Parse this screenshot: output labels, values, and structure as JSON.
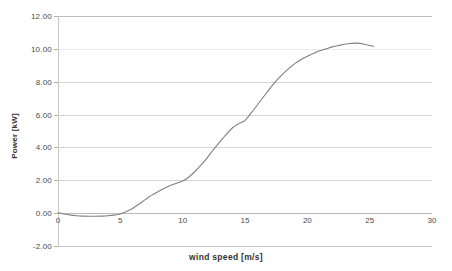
{
  "chart_data": {
    "type": "line",
    "title": "",
    "xlabel": "wind speed [m/s]",
    "ylabel": "Power [kW]",
    "xlim": [
      0,
      30
    ],
    "ylim": [
      -2.0,
      12.0
    ],
    "xticks": [
      0,
      5,
      10,
      15,
      20,
      25,
      30
    ],
    "xtick_labels": [
      "0",
      "5",
      "10",
      "15",
      "20",
      "25",
      "30"
    ],
    "yticks": [
      -2.0,
      0.0,
      2.0,
      4.0,
      6.0,
      8.0,
      10.0,
      12.0
    ],
    "ytick_labels": [
      "-2.00",
      "0.00",
      "2.00",
      "4.00",
      "6.00",
      "8.00",
      "10.00",
      "12.00"
    ],
    "grid": true,
    "grid_axis": "y",
    "legend": false,
    "legend_position": "none",
    "series": [
      {
        "name": "power curve",
        "color": "#808080",
        "x": [
          0.0,
          0.5,
          1.0,
          1.5,
          2.0,
          2.5,
          3.0,
          3.5,
          4.0,
          4.5,
          5.0,
          5.5,
          6.0,
          6.5,
          7.0,
          7.5,
          8.0,
          8.5,
          9.0,
          9.5,
          10.0,
          10.5,
          11.0,
          11.5,
          12.0,
          12.5,
          13.0,
          13.5,
          14.0,
          14.5,
          15.0,
          15.5,
          16.0,
          16.5,
          17.0,
          17.5,
          18.0,
          18.5,
          19.0,
          19.5,
          20.0,
          20.5,
          21.0,
          21.5,
          22.0,
          22.5,
          23.0,
          23.5,
          24.0,
          24.5,
          25.0,
          25.3
        ],
        "y": [
          0.02,
          -0.05,
          -0.12,
          -0.16,
          -0.18,
          -0.19,
          -0.19,
          -0.18,
          -0.16,
          -0.12,
          -0.05,
          0.1,
          0.3,
          0.55,
          0.82,
          1.08,
          1.3,
          1.5,
          1.68,
          1.82,
          1.95,
          2.2,
          2.55,
          2.95,
          3.4,
          3.9,
          4.35,
          4.8,
          5.2,
          5.45,
          5.65,
          6.1,
          6.6,
          7.1,
          7.6,
          8.05,
          8.45,
          8.8,
          9.1,
          9.35,
          9.55,
          9.72,
          9.88,
          10.0,
          10.12,
          10.2,
          10.28,
          10.33,
          10.35,
          10.3,
          10.2,
          10.15
        ]
      }
    ]
  },
  "axis": {
    "y_title": "Power [kW]",
    "x_title": "wind speed [m/s]"
  }
}
